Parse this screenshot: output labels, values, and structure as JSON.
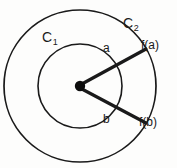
{
  "figure": {
    "background_color": "#fdfdfc",
    "stroke_color": "#1a1a1a",
    "text_color": "#1a1a1a"
  },
  "labels": {
    "outer_circle": "C",
    "outer_circle_sub": "2",
    "inner_circle": "C",
    "inner_circle_sub": "1",
    "point_a": "a",
    "point_b": "b",
    "image_a": "f(a)",
    "image_b": "f(b)"
  },
  "geometry": {
    "center": {
      "x": 80,
      "y": 86
    },
    "outer_radius": 76,
    "inner_radius": 42,
    "center_dot_radius": 5,
    "ray_upper": {
      "angle_deg": -29,
      "end_x": 146,
      "end_y": 49
    },
    "ray_lower": {
      "angle_deg": 29,
      "end_x": 146,
      "end_y": 123
    },
    "stroke_width_circle": 1.6,
    "stroke_width_ray": 3.2
  }
}
